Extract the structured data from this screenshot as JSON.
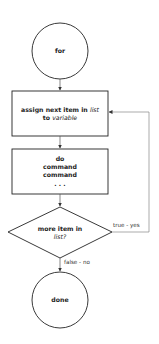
{
  "diagram": {
    "type": "flowchart",
    "nodes": {
      "start": {
        "shape": "circle",
        "label": "for"
      },
      "assign": {
        "shape": "rectangle",
        "line1_prefix": "assign next item in ",
        "line1_italic": "list",
        "line2_prefix": "to ",
        "line2_italic": "variable"
      },
      "body": {
        "shape": "rectangle",
        "lines": [
          "do",
          "command",
          "command",
          ". . ."
        ]
      },
      "decision": {
        "shape": "diamond",
        "line1": "more item in",
        "line2_italic": "list?"
      },
      "end": {
        "shape": "circle",
        "label": "done"
      }
    },
    "edges": {
      "true_label": "true - yes",
      "false_label": "false - no"
    },
    "colors": {
      "stroke": "#222222",
      "return_line": "#888888",
      "background": "#ffffff"
    }
  }
}
